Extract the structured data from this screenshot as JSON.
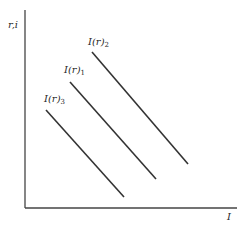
{
  "diagram": {
    "type": "investment-schedule",
    "y_axis_label": "r,i",
    "x_axis_label": "I",
    "line_color": "#333333",
    "axis_color": "#444444",
    "curves": [
      {
        "name": "I(r)3",
        "base": "I(r)",
        "sub": "3",
        "x1": 46,
        "y1": 110,
        "x2": 124,
        "y2": 197,
        "label_x": 44,
        "label_y": 94
      },
      {
        "name": "I(r)1",
        "base": "I(r)",
        "sub": "1",
        "x1": 70,
        "y1": 82,
        "x2": 156,
        "y2": 179,
        "label_x": 64,
        "label_y": 65
      },
      {
        "name": "I(r)2",
        "base": "I(r)",
        "sub": "2",
        "x1": 92,
        "y1": 52,
        "x2": 188,
        "y2": 164,
        "label_x": 88,
        "label_y": 37
      }
    ]
  }
}
